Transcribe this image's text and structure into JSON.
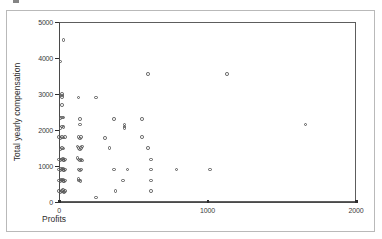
{
  "figure": {
    "background_color": "#ffffff",
    "frame_color": "#b9b9b9",
    "axis_color": "#4a4a4a",
    "marker_color": "#5a5a5a",
    "y_axis_title": "Total yearly compensation",
    "x_axis_title": "Profits"
  },
  "chart_data": {
    "type": "scatter",
    "title": "",
    "subtitle": "",
    "xlabel": "Profits",
    "ylabel": "Total yearly compensation",
    "xlim": [
      0,
      2000
    ],
    "ylim": [
      0,
      5000
    ],
    "xticks": [
      0,
      1000,
      2000
    ],
    "xticklabels": [
      "0",
      "1000",
      "2000"
    ],
    "yticks": [
      0,
      1000,
      2000,
      3000,
      4000,
      5000
    ],
    "yticklabels": [
      "0",
      "1000",
      "2000",
      "3000",
      "4000",
      "5000"
    ],
    "grid": false,
    "legend": null,
    "legend_position": "none",
    "marker": "open-circle",
    "annotations": [],
    "points": [
      [
        30,
        4500
      ],
      [
        10,
        3900
      ],
      [
        600,
        3550
      ],
      [
        1130,
        3550
      ],
      [
        20,
        3000
      ],
      [
        20,
        2960
      ],
      [
        20,
        2920
      ],
      [
        130,
        2900
      ],
      [
        250,
        2900
      ],
      [
        20,
        2700
      ],
      [
        20,
        2350
      ],
      [
        30,
        2350
      ],
      [
        10,
        2330
      ],
      [
        140,
        2300
      ],
      [
        370,
        2300
      ],
      [
        560,
        2300
      ],
      [
        20,
        2100
      ],
      [
        30,
        2080
      ],
      [
        10,
        2060
      ],
      [
        140,
        2150
      ],
      [
        440,
        2150
      ],
      [
        440,
        2100
      ],
      [
        440,
        2050
      ],
      [
        1660,
        2150
      ],
      [
        20,
        1800
      ],
      [
        30,
        1790
      ],
      [
        10,
        1780
      ],
      [
        40,
        1800
      ],
      [
        0,
        1800
      ],
      [
        130,
        1800
      ],
      [
        140,
        1760
      ],
      [
        150,
        1800
      ],
      [
        310,
        1780
      ],
      [
        560,
        1800
      ],
      [
        20,
        1500
      ],
      [
        30,
        1490
      ],
      [
        10,
        1480
      ],
      [
        130,
        1500
      ],
      [
        140,
        1460
      ],
      [
        150,
        1500
      ],
      [
        125,
        1540
      ],
      [
        155,
        1540
      ],
      [
        340,
        1500
      ],
      [
        600,
        1500
      ],
      [
        20,
        1180
      ],
      [
        30,
        1160
      ],
      [
        10,
        1160
      ],
      [
        40,
        1180
      ],
      [
        0,
        1180
      ],
      [
        25,
        1210
      ],
      [
        35,
        1150
      ],
      [
        130,
        1180
      ],
      [
        140,
        1150
      ],
      [
        150,
        1180
      ],
      [
        125,
        1215
      ],
      [
        155,
        1150
      ],
      [
        620,
        1180
      ],
      [
        20,
        900
      ],
      [
        30,
        890
      ],
      [
        10,
        880
      ],
      [
        40,
        900
      ],
      [
        0,
        900
      ],
      [
        25,
        930
      ],
      [
        35,
        870
      ],
      [
        15,
        925
      ],
      [
        130,
        900
      ],
      [
        140,
        880
      ],
      [
        150,
        900
      ],
      [
        370,
        900
      ],
      [
        460,
        900
      ],
      [
        620,
        900
      ],
      [
        790,
        900
      ],
      [
        1015,
        900
      ],
      [
        20,
        600
      ],
      [
        30,
        590
      ],
      [
        10,
        585
      ],
      [
        40,
        600
      ],
      [
        0,
        600
      ],
      [
        25,
        630
      ],
      [
        35,
        570
      ],
      [
        15,
        625
      ],
      [
        135,
        600
      ],
      [
        145,
        580
      ],
      [
        130,
        640
      ],
      [
        430,
        600
      ],
      [
        620,
        600
      ],
      [
        20,
        300
      ],
      [
        30,
        290
      ],
      [
        10,
        285
      ],
      [
        40,
        300
      ],
      [
        0,
        300
      ],
      [
        25,
        330
      ],
      [
        35,
        270
      ],
      [
        380,
        300
      ],
      [
        620,
        300
      ],
      [
        250,
        120
      ]
    ]
  }
}
